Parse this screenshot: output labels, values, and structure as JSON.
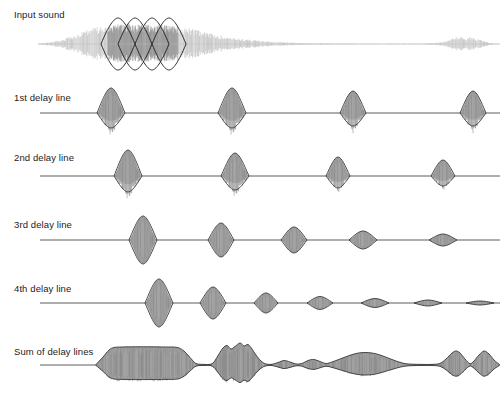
{
  "figure": {
    "title_visible": false,
    "width": 504,
    "height": 399,
    "background": "#ffffff",
    "ink_color": "#1c1c1c",
    "fill_gray": "#9a9a9a",
    "fill_gray_light": "#b4b4b4",
    "outline_color": "#3a3a3a",
    "baseline_color": "#4a4a4a"
  },
  "rows": [
    {
      "id": "input-sound",
      "label": "Input sound",
      "label_x": 14,
      "label_y": 18,
      "baseline_y": 44,
      "type": "waveform",
      "has_baseline": false,
      "waveform": {
        "x_start": 38,
        "x_end": 500,
        "envelope": [
          {
            "x": 38,
            "a": 0.5
          },
          {
            "x": 45,
            "a": 1.2
          },
          {
            "x": 52,
            "a": 2.0
          },
          {
            "x": 58,
            "a": 3.4
          },
          {
            "x": 64,
            "a": 5.0
          },
          {
            "x": 70,
            "a": 7.2
          },
          {
            "x": 76,
            "a": 9.5
          },
          {
            "x": 82,
            "a": 12.0
          },
          {
            "x": 88,
            "a": 14.5
          },
          {
            "x": 94,
            "a": 16.5
          },
          {
            "x": 100,
            "a": 18.2
          },
          {
            "x": 106,
            "a": 19.2
          },
          {
            "x": 114,
            "a": 19.6
          },
          {
            "x": 124,
            "a": 19.8
          },
          {
            "x": 134,
            "a": 19.8
          },
          {
            "x": 144,
            "a": 19.7
          },
          {
            "x": 154,
            "a": 19.5
          },
          {
            "x": 164,
            "a": 19.2
          },
          {
            "x": 172,
            "a": 18.8
          },
          {
            "x": 180,
            "a": 17.8
          },
          {
            "x": 188,
            "a": 16.2
          },
          {
            "x": 196,
            "a": 14.2
          },
          {
            "x": 204,
            "a": 12.0
          },
          {
            "x": 212,
            "a": 10.2
          },
          {
            "x": 220,
            "a": 8.6
          },
          {
            "x": 230,
            "a": 7.0
          },
          {
            "x": 240,
            "a": 5.6
          },
          {
            "x": 250,
            "a": 4.4
          },
          {
            "x": 260,
            "a": 3.3
          },
          {
            "x": 272,
            "a": 2.4
          },
          {
            "x": 284,
            "a": 1.7
          },
          {
            "x": 298,
            "a": 1.2
          },
          {
            "x": 312,
            "a": 0.9
          },
          {
            "x": 330,
            "a": 0.7
          },
          {
            "x": 350,
            "a": 0.6
          },
          {
            "x": 375,
            "a": 0.5
          },
          {
            "x": 400,
            "a": 0.5
          },
          {
            "x": 420,
            "a": 0.6
          },
          {
            "x": 435,
            "a": 1.0
          },
          {
            "x": 443,
            "a": 2.2
          },
          {
            "x": 450,
            "a": 5.0
          },
          {
            "x": 455,
            "a": 7.5
          },
          {
            "x": 459,
            "a": 6.2
          },
          {
            "x": 463,
            "a": 8.2
          },
          {
            "x": 467,
            "a": 6.0
          },
          {
            "x": 471,
            "a": 7.6
          },
          {
            "x": 475,
            "a": 5.4
          },
          {
            "x": 479,
            "a": 6.6
          },
          {
            "x": 483,
            "a": 3.6
          },
          {
            "x": 487,
            "a": 2.0
          },
          {
            "x": 492,
            "a": 0.9
          },
          {
            "x": 498,
            "a": 0.4
          },
          {
            "x": 500,
            "a": 0.2
          }
        ],
        "dark_region": {
          "x0": 108,
          "x1": 178
        }
      },
      "analysis_windows": [
        {
          "cx": 118,
          "half_width": 17,
          "half_height": 26
        },
        {
          "cx": 135,
          "half_width": 17,
          "half_height": 26
        },
        {
          "cx": 152,
          "half_width": 17,
          "half_height": 26
        },
        {
          "cx": 169,
          "half_width": 17,
          "half_height": 26
        }
      ]
    },
    {
      "id": "delay-line-1",
      "label": "1st delay line",
      "label_x": 14,
      "label_y": 101,
      "baseline_y": 113,
      "type": "pulses",
      "has_baseline": true,
      "baseline_x0": 40,
      "baseline_x1": 500,
      "shape": "asymmetric",
      "pulses": [
        {
          "cx": 111,
          "half_width": 14,
          "up": 25,
          "down": 15
        },
        {
          "cx": 232,
          "half_width": 14,
          "up": 25,
          "down": 15
        },
        {
          "cx": 353,
          "half_width": 13,
          "up": 22,
          "down": 13
        },
        {
          "cx": 473,
          "half_width": 13,
          "up": 22,
          "down": 13
        }
      ]
    },
    {
      "id": "delay-line-2",
      "label": "2nd delay line",
      "label_x": 14,
      "label_y": 161,
      "baseline_y": 176,
      "type": "pulses",
      "has_baseline": true,
      "baseline_x0": 40,
      "baseline_x1": 500,
      "shape": "asymmetric",
      "pulses": [
        {
          "cx": 128,
          "half_width": 14,
          "up": 26,
          "down": 16
        },
        {
          "cx": 235,
          "half_width": 14,
          "up": 23,
          "down": 14
        },
        {
          "cx": 338,
          "half_width": 12,
          "up": 19,
          "down": 12
        },
        {
          "cx": 443,
          "half_width": 12,
          "up": 16,
          "down": 10
        }
      ]
    },
    {
      "id": "delay-line-3",
      "label": "3rd delay line",
      "label_x": 14,
      "label_y": 228,
      "baseline_y": 240,
      "type": "pulses",
      "has_baseline": true,
      "baseline_x0": 40,
      "baseline_x1": 500,
      "shape": "symmetric",
      "pulses": [
        {
          "cx": 143,
          "half_width": 14,
          "up": 24,
          "down": 24
        },
        {
          "cx": 221,
          "half_width": 13,
          "up": 17,
          "down": 17
        },
        {
          "cx": 294,
          "half_width": 13,
          "up": 13,
          "down": 13
        },
        {
          "cx": 363,
          "half_width": 14,
          "up": 9,
          "down": 9
        },
        {
          "cx": 443,
          "half_width": 14,
          "up": 6,
          "down": 6
        }
      ]
    },
    {
      "id": "delay-line-4",
      "label": "4th delay line",
      "label_x": 14,
      "label_y": 292,
      "baseline_y": 303,
      "type": "pulses",
      "has_baseline": true,
      "baseline_x0": 40,
      "baseline_x1": 500,
      "shape": "symmetric",
      "pulses": [
        {
          "cx": 159,
          "half_width": 14,
          "up": 24,
          "down": 24
        },
        {
          "cx": 213,
          "half_width": 13,
          "up": 16,
          "down": 16
        },
        {
          "cx": 266,
          "half_width": 12,
          "up": 10,
          "down": 10
        },
        {
          "cx": 320,
          "half_width": 13,
          "up": 6.5,
          "down": 6.5
        },
        {
          "cx": 375,
          "half_width": 14,
          "up": 4.5,
          "down": 4.5
        },
        {
          "cx": 428,
          "half_width": 14,
          "up": 3.0,
          "down": 3.0
        },
        {
          "cx": 480,
          "half_width": 14,
          "up": 2.0,
          "down": 2.0
        }
      ]
    },
    {
      "id": "sum-of-delay-lines",
      "label": "Sum of delay lines",
      "label_x": 14,
      "label_y": 355,
      "baseline_y": 365,
      "type": "sum",
      "has_baseline": true,
      "baseline_x0": 40,
      "baseline_x1": 500,
      "envelope": [
        {
          "x": 96,
          "a": 0.5
        },
        {
          "x": 103,
          "a": 8.0
        },
        {
          "x": 109,
          "a": 15.0
        },
        {
          "x": 114,
          "a": 17.5
        },
        {
          "x": 122,
          "a": 18.0
        },
        {
          "x": 135,
          "a": 18.2
        },
        {
          "x": 150,
          "a": 18.2
        },
        {
          "x": 165,
          "a": 18.0
        },
        {
          "x": 177,
          "a": 17.6
        },
        {
          "x": 184,
          "a": 14.0
        },
        {
          "x": 190,
          "a": 7.5
        },
        {
          "x": 196,
          "a": 1.5
        },
        {
          "x": 204,
          "a": 0.6
        },
        {
          "x": 210,
          "a": 0.6
        },
        {
          "x": 214,
          "a": 3.0
        },
        {
          "x": 219,
          "a": 11.0
        },
        {
          "x": 223,
          "a": 17.0
        },
        {
          "x": 227,
          "a": 19.5
        },
        {
          "x": 231,
          "a": 16.0
        },
        {
          "x": 235,
          "a": 18.5
        },
        {
          "x": 240,
          "a": 22.0
        },
        {
          "x": 244,
          "a": 19.0
        },
        {
          "x": 248,
          "a": 20.5
        },
        {
          "x": 252,
          "a": 16.0
        },
        {
          "x": 256,
          "a": 10.0
        },
        {
          "x": 261,
          "a": 4.0
        },
        {
          "x": 266,
          "a": 1.0
        },
        {
          "x": 272,
          "a": 0.7
        },
        {
          "x": 278,
          "a": 2.5
        },
        {
          "x": 284,
          "a": 4.5
        },
        {
          "x": 290,
          "a": 3.0
        },
        {
          "x": 296,
          "a": 1.0
        },
        {
          "x": 302,
          "a": 1.5
        },
        {
          "x": 308,
          "a": 4.5
        },
        {
          "x": 314,
          "a": 5.5
        },
        {
          "x": 320,
          "a": 3.5
        },
        {
          "x": 326,
          "a": 1.5
        },
        {
          "x": 332,
          "a": 3.0
        },
        {
          "x": 340,
          "a": 6.0
        },
        {
          "x": 348,
          "a": 9.0
        },
        {
          "x": 356,
          "a": 11.5
        },
        {
          "x": 364,
          "a": 12.5
        },
        {
          "x": 372,
          "a": 12.0
        },
        {
          "x": 380,
          "a": 10.0
        },
        {
          "x": 388,
          "a": 7.0
        },
        {
          "x": 396,
          "a": 4.0
        },
        {
          "x": 404,
          "a": 1.6
        },
        {
          "x": 412,
          "a": 0.8
        },
        {
          "x": 422,
          "a": 0.6
        },
        {
          "x": 432,
          "a": 0.6
        },
        {
          "x": 440,
          "a": 1.6
        },
        {
          "x": 446,
          "a": 6.0
        },
        {
          "x": 452,
          "a": 12.0
        },
        {
          "x": 456,
          "a": 14.0
        },
        {
          "x": 460,
          "a": 12.0
        },
        {
          "x": 465,
          "a": 6.0
        },
        {
          "x": 470,
          "a": 1.2
        },
        {
          "x": 474,
          "a": 4.0
        },
        {
          "x": 479,
          "a": 10.0
        },
        {
          "x": 484,
          "a": 14.0
        },
        {
          "x": 489,
          "a": 11.0
        },
        {
          "x": 494,
          "a": 5.0
        },
        {
          "x": 499,
          "a": 0.8
        }
      ]
    }
  ]
}
